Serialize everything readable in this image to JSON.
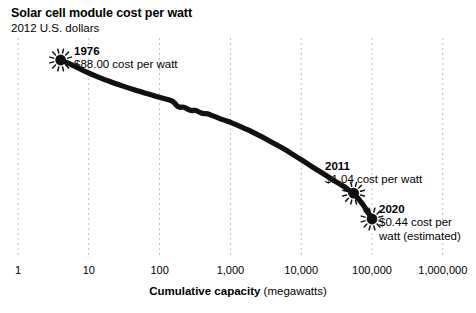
{
  "chart_data": {
    "type": "line",
    "title": "Solar cell module cost per watt",
    "subtitle": "2012 U.S. dollars",
    "xlabel_strong": "Cumulative capacity",
    "xlabel_rest": " (megawatts)",
    "ylabel": "",
    "xscale": "log",
    "yscale": "log",
    "grid": "vertical-dashed",
    "legend": "none",
    "xticks": [
      "1",
      "10",
      "100",
      "1,000",
      "10,000",
      "100,000",
      "1,000,000"
    ],
    "xtick_values": [
      1,
      10,
      100,
      1000,
      10000,
      100000,
      1000000
    ],
    "xlim": [
      1,
      1000000
    ],
    "series": [
      {
        "name": "Solar cell module cost per watt",
        "x": [
          4.0,
          5.2,
          6.6,
          8.3,
          10.5,
          13.5,
          17.5,
          22.5,
          29,
          37,
          47,
          60,
          76,
          96,
          122,
          155,
          172,
          190,
          215,
          245,
          280,
          320,
          360,
          410,
          470,
          540,
          620,
          720,
          840,
          980,
          1150,
          1350,
          1600,
          1900,
          2300,
          2800,
          3400,
          4200,
          5200,
          6500,
          8200,
          10500,
          13500,
          17500,
          23000,
          30000,
          40000,
          55000,
          75000,
          100000
        ],
        "y": [
          88.0,
          79.0,
          70.0,
          62.0,
          55.5,
          50.0,
          45.0,
          41.0,
          37.5,
          34.5,
          32.0,
          29.5,
          27.5,
          25.5,
          24.0,
          22.5,
          19.5,
          18.0,
          18.6,
          17.2,
          16.2,
          16.6,
          15.6,
          14.6,
          14.9,
          13.9,
          13.2,
          12.4,
          11.7,
          11.1,
          10.4,
          9.7,
          9.0,
          8.3,
          7.5,
          6.8,
          6.1,
          5.4,
          4.8,
          4.2,
          3.6,
          3.1,
          2.6,
          2.2,
          1.85,
          1.55,
          1.3,
          1.04,
          0.72,
          0.44
        ]
      }
    ],
    "annotations": [
      {
        "id": "1976",
        "year": "1976",
        "detail": "$88.00 cost per watt",
        "marker": "sunburst",
        "point_x": 4.0,
        "point_y": 88.0
      },
      {
        "id": "2011",
        "year": "2011",
        "detail": "$1.04 cost per watt",
        "marker": "sunburst",
        "point_x": 55000,
        "point_y": 1.04
      },
      {
        "id": "2020",
        "year": "2020",
        "detail_lines": "$0.44 cost per watt (estimated)",
        "marker": "sunburst",
        "point_x": 100000,
        "point_y": 0.44
      }
    ],
    "colors": {
      "line": "#111111",
      "grid": "#bdbdbd",
      "text": "#000000",
      "background": "#ffffff"
    }
  }
}
